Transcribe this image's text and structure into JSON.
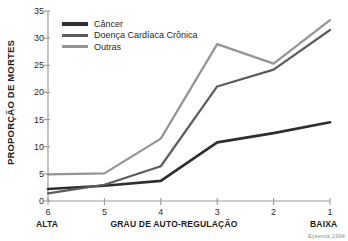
{
  "chart_data": {
    "type": "line",
    "title": "",
    "xlabel": "GRAU DE AUTO-REGULAÇÃO",
    "ylabel": "PROPORÇÃO DE MORTES",
    "categories": [
      "6",
      "5",
      "4",
      "3",
      "2",
      "1"
    ],
    "xlim_labels": {
      "left": "ALTA",
      "right": "BAIXA"
    },
    "ylim": [
      0,
      35
    ],
    "yticks": [
      0,
      5,
      10,
      15,
      20,
      25,
      30,
      35
    ],
    "grid": false,
    "legend_position": "top-left",
    "series": [
      {
        "name": "Câncer",
        "color": "#2e2e2e",
        "values": [
          2.2,
          2.8,
          3.7,
          10.8,
          12.5,
          14.5
        ]
      },
      {
        "name": "Doença Cardíaca Crônica",
        "color": "#5c5c5c",
        "values": [
          1.4,
          3.0,
          6.4,
          21.1,
          24.2,
          31.5
        ]
      },
      {
        "name": "Outras",
        "color": "#949494",
        "values": [
          4.9,
          5.1,
          11.5,
          28.9,
          25.3,
          33.3
        ]
      }
    ],
    "source_note": "Eysenck,1994"
  },
  "axis": {
    "y_title": "PROPORÇÃO DE MORTES",
    "x_title": "GRAU DE AUTO-REGULAÇÃO",
    "y_tick_labels": [
      "35",
      "30",
      "25",
      "20",
      "15",
      "10",
      "5",
      "0"
    ],
    "x_tick_labels": [
      "6",
      "5",
      "4",
      "3",
      "2",
      "1"
    ],
    "left_caption": "ALTA",
    "right_caption": "BAIXA"
  },
  "legend": {
    "items": [
      {
        "label": "Câncer"
      },
      {
        "label": "Doença Cardíaca Crônica"
      },
      {
        "label": "Outras"
      }
    ]
  },
  "footer": {
    "source": "Eysenck,1994"
  },
  "colors": {
    "series_cancer": "#2e2e2e",
    "series_heart": "#5c5c5c",
    "series_other": "#949494",
    "axis": "#9b9b9b",
    "text": "#1c1c1c"
  }
}
